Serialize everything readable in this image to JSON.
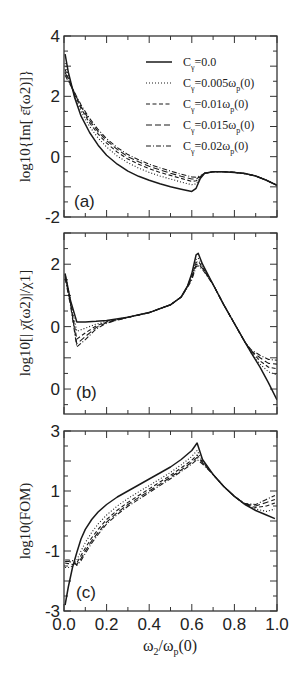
{
  "figure": {
    "xlabel_main": "ω",
    "xlabel_sub1": "2",
    "xlabel_mid": "/ω",
    "xlabel_sub2": "p",
    "xlabel_tail": "(0)",
    "x_ticks": [
      "0.0",
      "0.2",
      "0.4",
      "0.6",
      "0.8",
      "1.0"
    ],
    "legend": [
      {
        "label_pre": "C",
        "label_sub": "γ",
        "label_post": "=0.0",
        "style": "solid"
      },
      {
        "label_pre": "C",
        "label_sub": "γ",
        "label_post": "=0.005ω",
        "label_sub2": "p",
        "label_tail": "(0)",
        "style": "dotted"
      },
      {
        "label_pre": "C",
        "label_sub": "γ",
        "label_post": "=0.01ω",
        "label_sub2": "p",
        "label_tail": "(0)",
        "style": "dashed"
      },
      {
        "label_pre": "C",
        "label_sub": "γ",
        "label_post": "=0.015ω",
        "label_sub2": "p",
        "label_tail": "(0)",
        "style": "longdash"
      },
      {
        "label_pre": "C",
        "label_sub": "γ",
        "label_post": "=0.02ω",
        "label_sub2": "p",
        "label_tail": "(0)",
        "style": "dashdot"
      }
    ]
  },
  "chart_data": [
    {
      "type": "line",
      "panel": "(a)",
      "title": "",
      "xlabel": "ω2/ωp(0)",
      "ylabel": "log10{Im[ ε̄(ω2)]}",
      "xlim": [
        0.0,
        1.0
      ],
      "ylim": [
        -2,
        4
      ],
      "y_ticks": [
        "4",
        "2",
        "0",
        "-2"
      ],
      "y_tick_values": [
        4,
        2,
        0,
        -2
      ],
      "grid": false,
      "legend_position": "upper right",
      "x": [
        0.005,
        0.02,
        0.05,
        0.08,
        0.12,
        0.16,
        0.2,
        0.25,
        0.3,
        0.35,
        0.4,
        0.45,
        0.5,
        0.55,
        0.6,
        0.62,
        0.64,
        0.66,
        0.7,
        0.75,
        0.8,
        0.85,
        0.9,
        0.95,
        1.0
      ],
      "series": [
        {
          "name": "Cγ=0.0",
          "values": [
            3.4,
            2.8,
            1.95,
            1.35,
            0.8,
            0.38,
            0.05,
            -0.25,
            -0.48,
            -0.65,
            -0.78,
            -0.9,
            -1.0,
            -1.08,
            -1.15,
            -1.05,
            -0.72,
            -0.55,
            -0.5,
            -0.5,
            -0.52,
            -0.56,
            -0.64,
            -0.78,
            -0.95
          ]
        },
        {
          "name": "Cγ=0.005ωp(0)",
          "values": [
            3.1,
            2.7,
            2.0,
            1.5,
            1.0,
            0.62,
            0.32,
            0.02,
            -0.2,
            -0.38,
            -0.52,
            -0.64,
            -0.74,
            -0.84,
            -0.93,
            -0.9,
            -0.7,
            -0.55,
            -0.5,
            -0.5,
            -0.52,
            -0.56,
            -0.64,
            -0.78,
            -0.95
          ]
        },
        {
          "name": "Cγ=0.01ωp(0)",
          "values": [
            2.9,
            2.6,
            2.05,
            1.6,
            1.12,
            0.75,
            0.45,
            0.15,
            -0.08,
            -0.25,
            -0.4,
            -0.52,
            -0.62,
            -0.72,
            -0.82,
            -0.8,
            -0.68,
            -0.55,
            -0.5,
            -0.5,
            -0.52,
            -0.56,
            -0.64,
            -0.78,
            -0.95
          ]
        },
        {
          "name": "Cγ=0.015ωp(0)",
          "values": [
            2.8,
            2.55,
            2.1,
            1.66,
            1.2,
            0.83,
            0.53,
            0.24,
            0.0,
            -0.17,
            -0.32,
            -0.44,
            -0.55,
            -0.65,
            -0.74,
            -0.74,
            -0.66,
            -0.55,
            -0.5,
            -0.5,
            -0.52,
            -0.56,
            -0.64,
            -0.78,
            -0.95
          ]
        },
        {
          "name": "Cγ=0.02ωp(0)",
          "values": [
            2.7,
            2.5,
            2.12,
            1.72,
            1.27,
            0.9,
            0.6,
            0.3,
            0.07,
            -0.1,
            -0.25,
            -0.37,
            -0.48,
            -0.58,
            -0.67,
            -0.68,
            -0.63,
            -0.55,
            -0.5,
            -0.5,
            -0.52,
            -0.56,
            -0.64,
            -0.78,
            -0.95
          ]
        }
      ]
    },
    {
      "type": "line",
      "panel": "(b)",
      "title": "",
      "xlabel": "ω2/ωp(0)",
      "ylabel": "log10[| χ̄(ω2)|/χ1]",
      "xlim": [
        0.0,
        1.0
      ],
      "ylim": [
        -2.8,
        3.0
      ],
      "y_ticks": [
        "2",
        "0",
        "0"
      ],
      "y_tick_values": [
        2,
        0,
        -2
      ],
      "grid": false,
      "x": [
        0.005,
        0.03,
        0.06,
        0.1,
        0.15,
        0.2,
        0.3,
        0.4,
        0.5,
        0.55,
        0.58,
        0.6,
        0.62,
        0.63,
        0.65,
        0.7,
        0.75,
        0.8,
        0.85,
        0.88,
        0.92,
        0.96,
        1.0
      ],
      "series": [
        {
          "name": "Cγ=0.0",
          "values": [
            1.7,
            0.85,
            0.15,
            0.15,
            0.17,
            0.2,
            0.3,
            0.45,
            0.7,
            0.95,
            1.3,
            1.7,
            2.3,
            2.35,
            2.0,
            1.35,
            0.7,
            0.1,
            -0.5,
            -0.85,
            -1.3,
            -1.8,
            -2.35
          ]
        },
        {
          "name": "Cγ=0.005ωp(0)",
          "values": [
            1.7,
            0.85,
            -0.15,
            -0.05,
            0.08,
            0.17,
            0.3,
            0.45,
            0.7,
            0.95,
            1.3,
            1.65,
            2.15,
            2.2,
            1.95,
            1.35,
            0.7,
            0.1,
            -0.5,
            -0.85,
            -1.2,
            -1.45,
            -1.55
          ]
        },
        {
          "name": "Cγ=0.01ωp(0)",
          "values": [
            1.65,
            0.8,
            -0.4,
            -0.2,
            0.02,
            0.15,
            0.3,
            0.45,
            0.7,
            0.95,
            1.3,
            1.6,
            2.05,
            2.1,
            1.9,
            1.35,
            0.7,
            0.1,
            -0.5,
            -0.8,
            -1.1,
            -1.3,
            -1.35
          ]
        },
        {
          "name": "Cγ=0.015ωp(0)",
          "values": [
            1.6,
            0.75,
            -0.55,
            -0.32,
            -0.03,
            0.13,
            0.3,
            0.45,
            0.7,
            0.95,
            1.28,
            1.55,
            1.98,
            2.02,
            1.87,
            1.35,
            0.7,
            0.1,
            -0.5,
            -0.78,
            -1.0,
            -1.18,
            -1.2
          ]
        },
        {
          "name": "Cγ=0.02ωp(0)",
          "values": [
            1.55,
            0.7,
            -0.65,
            -0.42,
            -0.08,
            0.11,
            0.3,
            0.45,
            0.7,
            0.95,
            1.25,
            1.5,
            1.92,
            1.95,
            1.83,
            1.35,
            0.7,
            0.1,
            -0.5,
            -0.75,
            -0.92,
            -1.05,
            -1.08
          ]
        }
      ]
    },
    {
      "type": "line",
      "panel": "(c)",
      "title": "",
      "xlabel": "ω2/ωp(0)",
      "ylabel": "log10(FOM)",
      "xlim": [
        0.0,
        1.0
      ],
      "ylim": [
        -3,
        3
      ],
      "y_ticks": [
        "3",
        "1",
        "-1",
        "-3"
      ],
      "y_tick_values": [
        3,
        1,
        -1,
        -3
      ],
      "grid": false,
      "x": [
        0.005,
        0.02,
        0.04,
        0.06,
        0.08,
        0.1,
        0.13,
        0.16,
        0.2,
        0.25,
        0.3,
        0.35,
        0.4,
        0.45,
        0.5,
        0.55,
        0.6,
        0.625,
        0.65,
        0.7,
        0.75,
        0.8,
        0.85,
        0.9,
        0.95,
        0.99
      ],
      "series": [
        {
          "name": "Cγ=0.0",
          "values": [
            -2.8,
            -2.2,
            -1.55,
            -1.05,
            -0.6,
            -0.28,
            0.05,
            0.3,
            0.55,
            0.8,
            1.0,
            1.2,
            1.4,
            1.6,
            1.8,
            2.05,
            2.35,
            2.6,
            2.05,
            1.55,
            1.15,
            0.82,
            0.55,
            0.35,
            0.2,
            0.08
          ]
        },
        {
          "name": "Cγ=0.005ωp(0)",
          "values": [
            -1.55,
            -1.55,
            -1.5,
            -1.3,
            -1.0,
            -0.72,
            -0.38,
            -0.1,
            0.2,
            0.5,
            0.75,
            0.97,
            1.18,
            1.4,
            1.62,
            1.87,
            2.15,
            2.35,
            2.0,
            1.55,
            1.15,
            0.82,
            0.55,
            0.4,
            0.32,
            0.4
          ]
        },
        {
          "name": "Cγ=0.01ωp(0)",
          "values": [
            -1.4,
            -1.42,
            -1.45,
            -1.4,
            -1.15,
            -0.9,
            -0.56,
            -0.28,
            0.05,
            0.36,
            0.62,
            0.85,
            1.07,
            1.3,
            1.52,
            1.77,
            2.03,
            2.2,
            1.97,
            1.55,
            1.15,
            0.82,
            0.55,
            0.45,
            0.5,
            0.6
          ]
        },
        {
          "name": "Cγ=0.015ωp(0)",
          "values": [
            -1.35,
            -1.35,
            -1.38,
            -1.45,
            -1.25,
            -1.0,
            -0.66,
            -0.38,
            -0.04,
            0.28,
            0.55,
            0.78,
            1.0,
            1.23,
            1.46,
            1.7,
            1.96,
            2.12,
            1.94,
            1.55,
            1.15,
            0.82,
            0.57,
            0.5,
            0.62,
            0.72
          ]
        },
        {
          "name": "Cγ=0.02ωp(0)",
          "values": [
            -1.3,
            -1.3,
            -1.32,
            -1.48,
            -1.32,
            -1.08,
            -0.74,
            -0.45,
            -0.1,
            0.22,
            0.49,
            0.72,
            0.95,
            1.18,
            1.41,
            1.65,
            1.9,
            2.05,
            1.9,
            1.55,
            1.15,
            0.82,
            0.58,
            0.55,
            0.72,
            0.85
          ]
        }
      ]
    }
  ]
}
